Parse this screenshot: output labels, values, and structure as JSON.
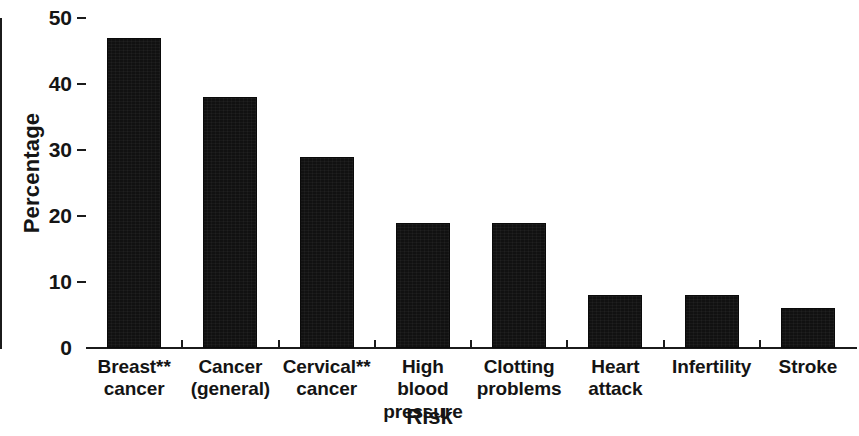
{
  "chart_data": {
    "type": "bar",
    "title": "",
    "xlabel": "Risk",
    "ylabel": "Percentage",
    "categories": [
      "Breast** cancer",
      "Cancer (general)",
      "Cervical** cancer",
      "High blood pressure",
      "Clotting problems",
      "Heart attack",
      "Infertility",
      "Stroke"
    ],
    "category_lines": [
      [
        "Breast**",
        "cancer"
      ],
      [
        "Cancer",
        "(general)"
      ],
      [
        "Cervical**",
        "cancer"
      ],
      [
        "High blood",
        "pressure"
      ],
      [
        "Clotting",
        "problems"
      ],
      [
        "Heart",
        "attack"
      ],
      [
        "Infertility",
        ""
      ],
      [
        "Stroke",
        ""
      ]
    ],
    "values": [
      47,
      38,
      29,
      19,
      19,
      8,
      8,
      6
    ],
    "ylim": [
      0,
      50
    ],
    "yticks": [
      0,
      10,
      20,
      30,
      40,
      50
    ],
    "ytick_labels": [
      "0",
      "10",
      "20",
      "30",
      "40",
      "50"
    ],
    "grid": false,
    "legend": null,
    "bar_color": "#111111",
    "axis_color": "#1b1b1b",
    "background_color": "#ffffff"
  }
}
